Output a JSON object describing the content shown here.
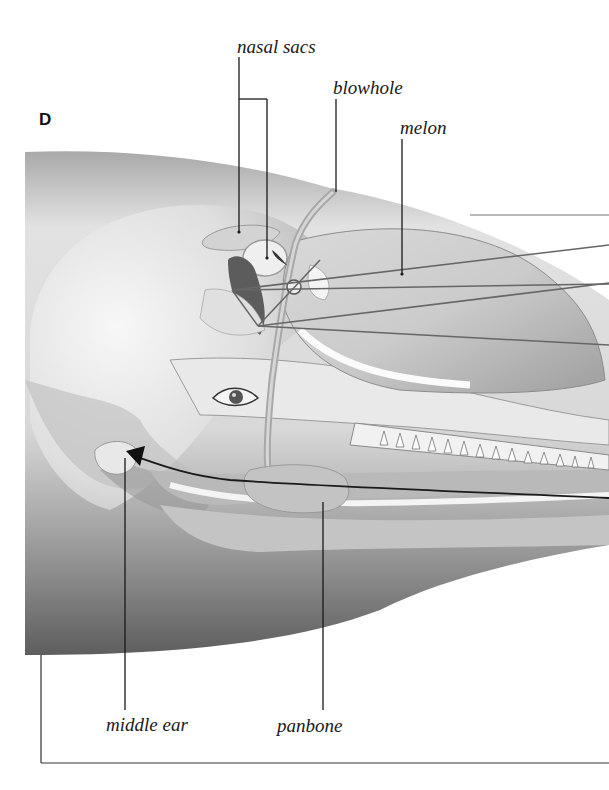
{
  "figure": {
    "panel_letter": "D",
    "labels": {
      "nasal_sacs": "nasal sacs",
      "blowhole": "blowhole",
      "melon": "melon",
      "middle_ear": "middle ear",
      "panbone": "panbone"
    },
    "colors": {
      "background": "#ffffff",
      "line": "#1a1a1a",
      "skin_dark": "#6e6e6e",
      "skin_light": "#e6e6e6",
      "tissue": "#cfcfcf",
      "bone": "#bdbdbd"
    }
  }
}
